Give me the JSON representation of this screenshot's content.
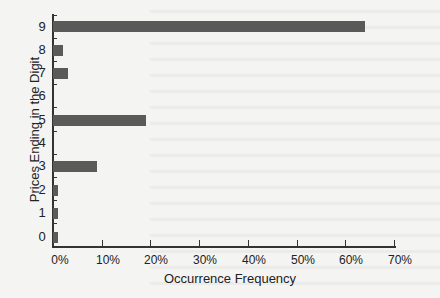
{
  "chart_data": {
    "type": "bar",
    "orientation": "horizontal",
    "title": "",
    "xlabel": "Occurrence Frequency",
    "ylabel": "Prices Ending in the Digit",
    "categories": [
      "0",
      "1",
      "2",
      "3",
      "4",
      "5",
      "6",
      "7",
      "8",
      "9"
    ],
    "values": [
      1,
      1,
      1,
      9,
      0,
      19,
      0,
      3,
      2,
      64
    ],
    "value_unit": "%",
    "xlim": [
      0,
      70
    ],
    "x_ticks": [
      "0%",
      "10%",
      "20%",
      "30%",
      "40%",
      "50%",
      "60%",
      "70%"
    ],
    "grid": false,
    "legend": null,
    "bar_color": "#5a5a5a"
  },
  "labels": {
    "x_title": "Occurrence Frequency",
    "y_title": "Prices Ending in the Digit",
    "y_ticks": [
      "9",
      "8",
      "7",
      "6",
      "5",
      "4",
      "3",
      "2",
      "1",
      "0"
    ],
    "x_ticks": [
      "0%",
      "10%",
      "20%",
      "30%",
      "40%",
      "50%",
      "60%",
      "70%"
    ]
  }
}
